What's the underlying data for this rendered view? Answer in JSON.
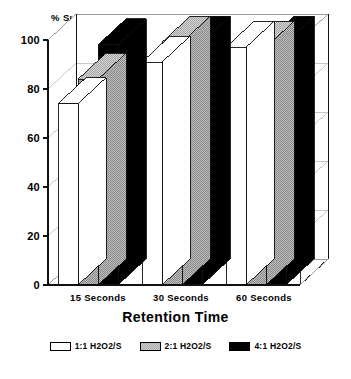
{
  "chart_data": {
    "type": "bar",
    "title": "% Sulfide Oxidized",
    "xlabel": "Retention Time",
    "ylabel": "% Sulfide Oxidized",
    "categories": [
      "15 Seconds",
      "30 Seconds",
      "60 Seconds"
    ],
    "series": [
      {
        "name": "1:1 H2O2/S",
        "color": "#ffffff",
        "values": [
          74,
          91,
          97
        ]
      },
      {
        "name": "2:1 H2O2/S",
        "color": "#a9a9a9",
        "values": [
          84,
          99,
          97
        ]
      },
      {
        "name": "4:1 H2O2/S",
        "color": "#000000",
        "values": [
          98,
          99,
          99
        ]
      }
    ],
    "ylim": [
      0,
      100
    ],
    "yticks": [
      "0",
      "20",
      "40",
      "60",
      "80",
      "100"
    ],
    "ytick_values": [
      0,
      20,
      40,
      60,
      80,
      100
    ],
    "grid": true,
    "legend_position": "bottom",
    "style": "3d-bar"
  },
  "legend": {
    "items": [
      {
        "label": "1:1 H2O2/S",
        "swatch": "white"
      },
      {
        "label": "2:1 H2O2/S",
        "swatch": "gray"
      },
      {
        "label": "4:1 H2O2/S",
        "swatch": "black"
      }
    ]
  }
}
